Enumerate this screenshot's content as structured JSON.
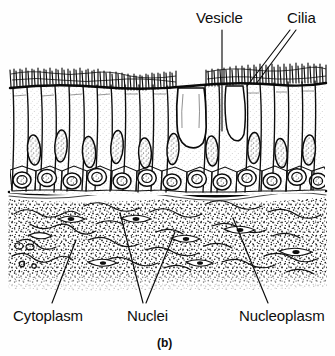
{
  "figure": {
    "caption": "(b)",
    "background_color": "#fefefe",
    "ink_color": "#111111"
  },
  "labels": {
    "vesicle": "Vesicle",
    "cilia": "Cilia",
    "cytoplasm": "Cytoplasm",
    "nuclei": "Nuclei",
    "nucleoplasm": "Nucleoplasm"
  },
  "leader_lines": {
    "vesicle": {
      "from": [
        222,
        30
      ],
      "to": [
        222,
        131
      ]
    },
    "cilia_a": {
      "from": [
        290,
        30
      ],
      "to": [
        247,
        86
      ]
    },
    "cilia_b": {
      "from": [
        296,
        30
      ],
      "to": [
        256,
        84
      ]
    },
    "cytoplasm": {
      "from": [
        52,
        303
      ],
      "to": [
        76,
        240
      ]
    },
    "nuclei_a": {
      "from": [
        143,
        303
      ],
      "to": [
        120,
        213
      ]
    },
    "nuclei_b": {
      "from": [
        146,
        303
      ],
      "to": [
        175,
        232
      ]
    },
    "nucleoplasm": {
      "from": [
        268,
        303
      ],
      "to": [
        233,
        218
      ]
    }
  },
  "regions": {
    "cilia_band": {
      "label": "cilia-band",
      "y_top": 68,
      "y_bottom": 92
    },
    "epithelium": {
      "label": "columnar-epithelium",
      "y_top": 88,
      "y_bottom": 190
    },
    "basement_membrane": {
      "label": "basement-membrane",
      "y": 192
    },
    "connective_tissue": {
      "label": "stippled-connective-tissue",
      "y_top": 196,
      "y_bottom": 290
    }
  }
}
